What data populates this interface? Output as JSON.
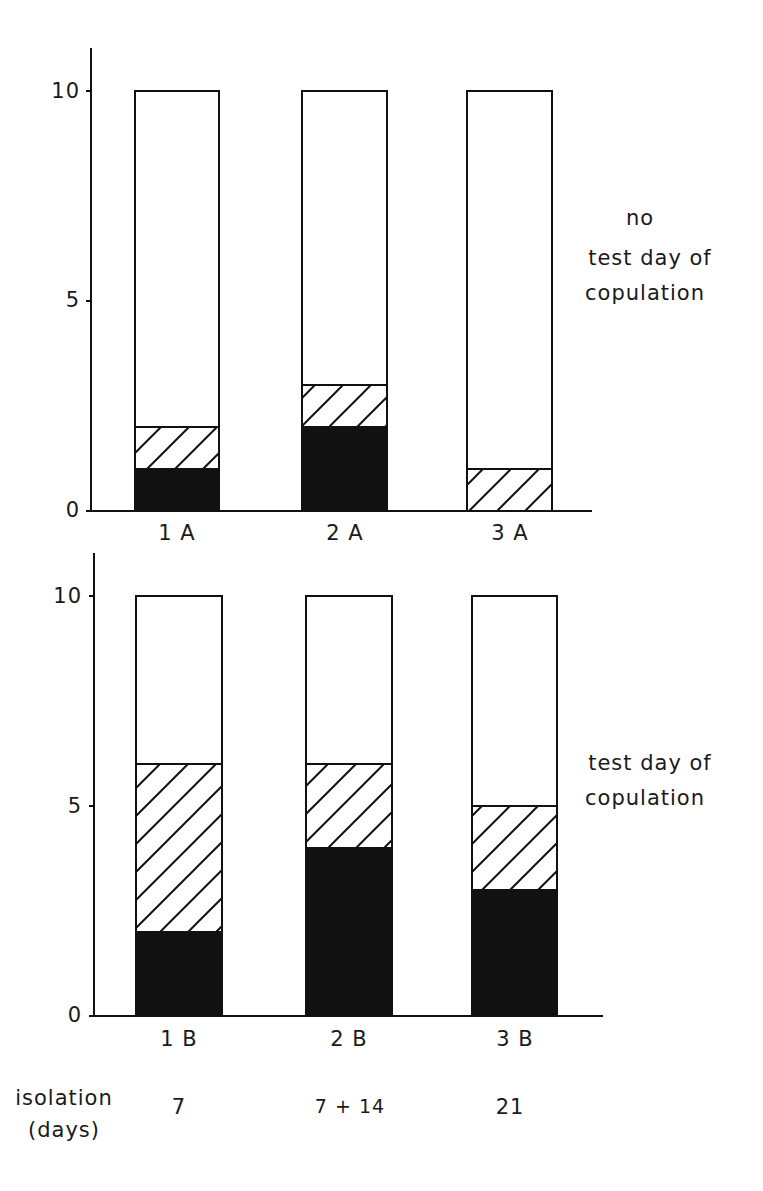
{
  "chart_data": [
    {
      "type": "bar",
      "stacked": true,
      "panel": "top",
      "side_label": [
        "no",
        "test day of",
        "copulation"
      ],
      "categories": [
        "1 A",
        "2 A",
        "3 A"
      ],
      "series": [
        {
          "name": "solid (black)",
          "values": [
            1,
            2,
            0
          ]
        },
        {
          "name": "hatched",
          "values": [
            1,
            1,
            1
          ]
        },
        {
          "name": "open (white)",
          "values": [
            8,
            7,
            9
          ]
        }
      ],
      "totals": [
        10,
        10,
        10
      ],
      "yticks": [
        0,
        5,
        10
      ],
      "ylim": [
        0,
        11
      ],
      "xlabel": "",
      "ylabel": "",
      "grid": false
    },
    {
      "type": "bar",
      "stacked": true,
      "panel": "bottom",
      "side_label": [
        "test day of",
        "copulation"
      ],
      "categories": [
        "1 B",
        "2 B",
        "3 B"
      ],
      "series": [
        {
          "name": "solid (black)",
          "values": [
            2,
            4,
            3
          ]
        },
        {
          "name": "hatched",
          "values": [
            4,
            2,
            2
          ]
        },
        {
          "name": "open (white)",
          "values": [
            4,
            4,
            5
          ]
        }
      ],
      "totals": [
        10,
        10,
        10
      ],
      "yticks": [
        0,
        5,
        10
      ],
      "ylim": [
        0,
        11
      ],
      "xlabel": "",
      "ylabel": "",
      "grid": false
    }
  ],
  "top": {
    "yticks": [
      "0",
      "5",
      "10"
    ],
    "categories": [
      "1 A",
      "2 A",
      "3 A"
    ],
    "side_label": {
      "line1": "no",
      "line2": "test day of",
      "line3": "copulation"
    }
  },
  "bottom": {
    "yticks": [
      "0",
      "5",
      "10"
    ],
    "categories": [
      "1 B",
      "2 B",
      "3 B"
    ],
    "side_label": {
      "line1": "test day of",
      "line2": "copulation"
    }
  },
  "isolation": {
    "label_line1": "isolation",
    "label_line2": "(days)",
    "values": [
      "7",
      "7 + 14",
      "21"
    ]
  },
  "colors": {
    "ink": "#111111",
    "background": "#ffffff"
  }
}
